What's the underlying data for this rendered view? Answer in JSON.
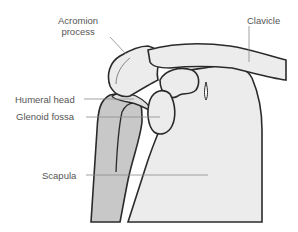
{
  "diagram": {
    "type": "anatomical-illustration",
    "labels": [
      {
        "id": "acromion",
        "text_line1": "Acromion",
        "text_line2": "process"
      },
      {
        "id": "clavicle",
        "text": "Clavicle"
      },
      {
        "id": "humeral_head",
        "text": "Humeral head"
      },
      {
        "id": "glenoid_fossa",
        "text": "Glenoid fossa"
      },
      {
        "id": "scapula",
        "text": "Scapula"
      }
    ],
    "colors": {
      "outline": "#2a2a2a",
      "bone_light": "#ececec",
      "humerus_fill": "#c8c8c8",
      "leader_line": "#8a8a8a",
      "label_text": "#555555"
    }
  }
}
